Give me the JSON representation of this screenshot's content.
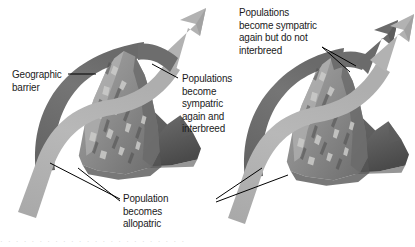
{
  "figure": {
    "background_color": "#ffffff",
    "text_color": "#1a1a1a"
  },
  "labels": {
    "geographic_barrier": "Geographic\nbarrier",
    "sympatric_interbreed": "Populations\nbecome\nsympatric\nagain and\ninterbreed",
    "sympatric_no_interbreed": "Populations\nbecome sympatric\nagain but do not\ninterbreed",
    "allopatric": "Population\nbecomes\nallopatric"
  },
  "panels": [
    {
      "id": "left-panel",
      "name": "speciation-does-not-occur",
      "outcome": "interbreed",
      "arrowheads": 1,
      "callouts": [
        "geographic_barrier",
        "sympatric_interbreed",
        "allopatric"
      ]
    },
    {
      "id": "right-panel",
      "name": "speciation-occurs",
      "outcome": "do-not-interbreed",
      "arrowheads": 2,
      "callouts": [
        "sympatric_no_interbreed",
        "allopatric"
      ]
    }
  ],
  "colors": {
    "arrow_light": "#b3b3b3",
    "arrow_light_edge": "#9a9a9a",
    "arrow_dark": "#6e6e6e",
    "arrow_dark_edge": "#5a5a5a",
    "mountain_mid": "#8d8d8d",
    "mountain_high": "#c9c9c9",
    "mountain_low": "#5e5e5e",
    "mountain_back": "#707070",
    "mountain_back_dark": "#4f4f4f",
    "leader_line": "#000000"
  },
  "bleed_text": "· · · · · · · · · · · · · · · · · · · · · · · ·"
}
